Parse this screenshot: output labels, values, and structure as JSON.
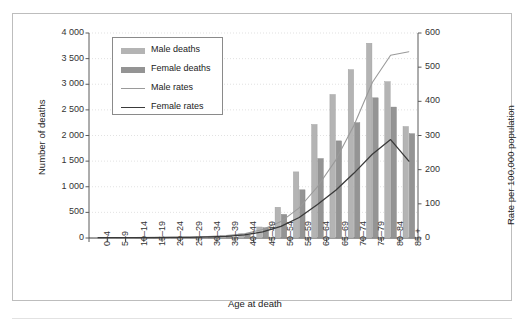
{
  "chart_data": {
    "type": "bar",
    "title": "",
    "xlabel": "Age at death",
    "ylabel": "Number of deaths",
    "y2label": "Rate per 100,000 population",
    "ylim": [
      0,
      4000
    ],
    "y2lim": [
      0,
      600
    ],
    "grid": true,
    "legend_position": "top-left",
    "categories": [
      "0–4",
      "5–9",
      "10–14",
      "15–19",
      "20–24",
      "25–29",
      "30–34",
      "35–39",
      "40–44",
      "45–49",
      "50–54",
      "55–59",
      "60–64",
      "65–69",
      "70–74",
      "75–79",
      "80–84",
      "85 +"
    ],
    "y_ticks": [
      "0",
      "500",
      "1 000",
      "1 500",
      "2 000",
      "2 500",
      "3 000",
      "3 500",
      "4 000"
    ],
    "y2_ticks": [
      "0",
      "100",
      "200",
      "300",
      "400",
      "500",
      "600"
    ],
    "series": [
      {
        "name": "Male deaths",
        "type": "bar",
        "axis": "left",
        "color": "#b4b4b4",
        "values": [
          8,
          5,
          6,
          10,
          14,
          18,
          28,
          45,
          80,
          215,
          600,
          1290,
          2215,
          2800,
          3285,
          3800,
          3050,
          2175
        ]
      },
      {
        "name": "Female deaths",
        "type": "bar",
        "axis": "left",
        "color": "#949494",
        "values": [
          6,
          4,
          5,
          8,
          11,
          15,
          24,
          40,
          60,
          200,
          460,
          940,
          1550,
          1895,
          2250,
          2735,
          2555,
          2035
        ]
      },
      {
        "name": "Male rates",
        "type": "line",
        "axis": "right",
        "color": "#9a9a9a",
        "values": [
          1,
          1,
          1,
          2,
          2,
          3,
          4,
          7,
          12,
          25,
          48,
          88,
          150,
          228,
          330,
          455,
          535,
          545
        ]
      },
      {
        "name": "Female rates",
        "type": "line",
        "axis": "right",
        "color": "#3a3a3a",
        "values": [
          1,
          1,
          1,
          1,
          2,
          2,
          3,
          5,
          9,
          18,
          34,
          60,
          98,
          140,
          190,
          245,
          288,
          225
        ]
      }
    ]
  },
  "legend": {
    "items": [
      {
        "label": "Male deaths",
        "marker": "bar-swatch"
      },
      {
        "label": "Female deaths",
        "marker": "bar-swatch"
      },
      {
        "label": "Male rates",
        "marker": "line-swatch"
      },
      {
        "label": "Female rates",
        "marker": "line-swatch"
      }
    ]
  }
}
